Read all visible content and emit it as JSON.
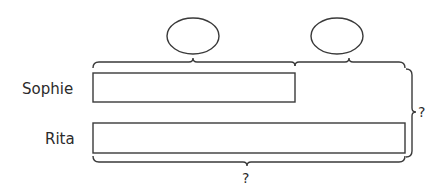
{
  "diagram": {
    "type": "bar-model",
    "rows": [
      {
        "name": "Sophie",
        "bar_length": "short"
      },
      {
        "name": "Rita",
        "bar_length": "long"
      }
    ],
    "top_ovals": [
      {
        "position": "over Sophie bar",
        "value": ""
      },
      {
        "position": "over Rita difference",
        "value": ""
      }
    ],
    "right_brace_label": "?",
    "bottom_brace_label": "?"
  },
  "colors": {
    "stroke": "#3a3a3a",
    "text": "#2b2b2b",
    "background": "#ffffff"
  }
}
